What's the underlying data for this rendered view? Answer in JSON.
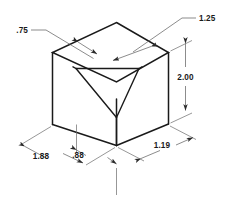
{
  "drawing": {
    "title": "Isometric block with V-groove",
    "view_type": "isometric",
    "units": "inches",
    "background_color": "#ffffff",
    "line_color": "#1a1a1a",
    "dimension_line_color": "#5a5a5a"
  },
  "dimensions": {
    "groove_top_left": {
      "label": ".75",
      "name": "groove-left-width",
      "placement": "upper-left-leader"
    },
    "groove_top_right": {
      "label": "1.25",
      "name": "groove-right-width",
      "placement": "upper-right-leader"
    },
    "height": {
      "label": "2.00",
      "name": "block-height",
      "placement": "right-vertical"
    },
    "depth": {
      "label": "1.88",
      "name": "block-depth",
      "placement": "lower-left"
    },
    "groove_offset": {
      "label": ".88",
      "name": "groove-offset",
      "placement": "lower-center"
    },
    "width": {
      "label": "1.19",
      "name": "block-width",
      "placement": "lower-right"
    }
  }
}
